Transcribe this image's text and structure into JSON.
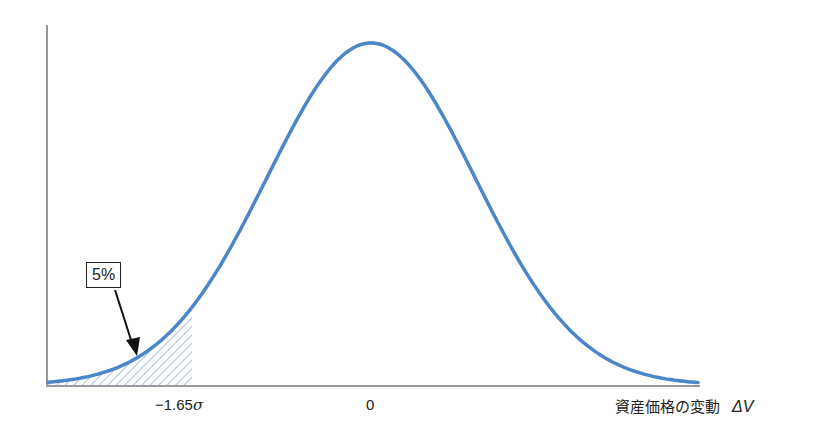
{
  "chart_data": {
    "type": "area",
    "title": "",
    "xlabel": "資産価格の変動 ΔV",
    "ylabel": "",
    "distribution": "normal",
    "mean": 0,
    "x_ticks": [
      {
        "value": -1.65,
        "label": "−1.65σ"
      },
      {
        "value": 0,
        "label": "0"
      }
    ],
    "shaded_region": {
      "from": "-inf",
      "to": -1.65,
      "label": "5%",
      "pattern": "diagonal-hatch"
    },
    "annotations": [
      {
        "text": "5%",
        "points_to": "left tail area"
      }
    ],
    "grid": false,
    "legend": null
  },
  "labels": {
    "tick_neg": "−1.65",
    "sigma": "σ",
    "tick_zero": "0",
    "xaxis_text": "資産価格の変動",
    "xaxis_var": "ΔV",
    "tail_pct": "5%"
  },
  "colors": {
    "curve": "#4a86c8",
    "hatch": "#8fb4dc",
    "axis": "#9a9a9a",
    "text": "#222222"
  }
}
